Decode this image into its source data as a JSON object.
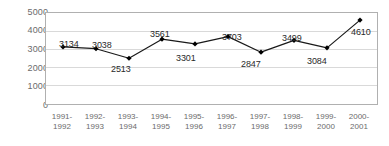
{
  "chart_data": {
    "type": "line",
    "title": "",
    "subtitle": "",
    "xlabel": "",
    "ylabel": "",
    "ylim": [
      0,
      5000
    ],
    "ytick_values": [
      5000,
      4000,
      3000,
      2000,
      1000,
      0
    ],
    "ytick_labels": [
      "5000",
      "4000",
      "3000",
      "2000",
      "1000",
      "0"
    ],
    "grid": true,
    "grid_axis": "y",
    "legend": false,
    "legend_position": "none",
    "marker": "diamond",
    "categories": [
      "1991-1992",
      "1992-1993",
      "1993-1994",
      "1994-1995",
      "1995-1996",
      "1996-1997",
      "1997-1998",
      "1998-1999",
      "1999-2000",
      "2000-2001"
    ],
    "category_lines": [
      {
        "line1": "1991-",
        "line2": "1992"
      },
      {
        "line1": "1992-",
        "line2": "1993"
      },
      {
        "line1": "1993-",
        "line2": "1994"
      },
      {
        "line1": "1994-",
        "line2": "1995"
      },
      {
        "line1": "1995-",
        "line2": "1996"
      },
      {
        "line1": "1996-",
        "line2": "1997"
      },
      {
        "line1": "1997-",
        "line2": "1998"
      },
      {
        "line1": "1998-",
        "line2": "1999"
      },
      {
        "line1": "1999-",
        "line2": "2000"
      },
      {
        "line1": "2000-",
        "line2": "2001"
      }
    ],
    "values": [
      3134,
      3038,
      2513,
      3561,
      3301,
      3703,
      2847,
      3499,
      3084,
      4610
    ],
    "point_labels": [
      "3134",
      "3038",
      "2513",
      "3561",
      "3301",
      "3703",
      "2847",
      "3499",
      "3084",
      "4610"
    ],
    "colors": {
      "line": "#1a1a1a",
      "marker": "#000000",
      "grid": "#d9d9d9",
      "axis": "#b0b0b0",
      "tick_text": "#6b6b6b",
      "label_text": "#2a2a2a",
      "background": "#ffffff"
    }
  }
}
